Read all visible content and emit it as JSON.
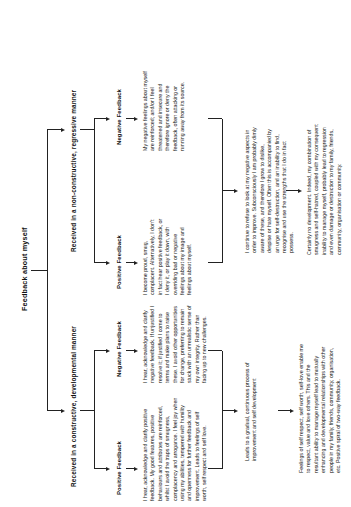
{
  "diagram": {
    "type": "flowchart",
    "orientation": "rotated-90-ccw",
    "root": {
      "label": "Feedback about myself"
    },
    "branches": [
      {
        "id": "constructive",
        "label": "Received in a constructive, developmental manner",
        "leaves": [
          {
            "id": "constructive-positive",
            "label": "Positive Feedback",
            "body": "I hear, acknowledge and clarify positive feedback. My good features, positive behaviours and attributes are reinforced, whilst I avoid the traps of smugness, complacency and arrogance. I feel joy when using my abilities, tempered with humility and openness for further feedback and improvement. Leads to feelings of self worth, self respect and self love."
          },
          {
            "id": "constructive-negative",
            "label": "Negative Feedback",
            "body": "I hear, acknowledge and clarify negative feedback. If unjustified I resolve it; if justified I come to terms and make plans to raise these. I avoid other opportunities for change, preferring to remain stuck with an unrealistic sense of my own integrity. Rather than facing up to new challenges."
          }
        ],
        "outcome_label": "Leads to a gradual, continuous process of improvement and self development",
        "outcome_body": "Feelings of self respect, self worth, self-love enable me to respect, value and love others. This and the resultant ability to manage myself lead to mutually enhancing and developmental relationships with other people in my family, friends, community, organisation, etc. Positive spiral of two-way feedback."
      },
      {
        "id": "non-constructive",
        "label": "Received in a non-constructive, regressive manner",
        "leaves": [
          {
            "id": "non-constructive-positive",
            "label": "Positive Feedback",
            "body": "I become proud, smug, complacent. Alternatively, I don't in fact hear positive feedback, or I deny it, or play it down, with overriding bad or negative feelings about my image and feelings about myself."
          },
          {
            "id": "non-constructive-negative",
            "label": "Negative Feedback",
            "body": "My negative feelings about myself are reinforced; and/or I feel threatened and insecure and therefore ignore or deny the feedback, often attacking or running away from its source."
          }
        ],
        "outcome_label": "I continue to refuse to look at my negative aspects in order to improve. Subconsciously I am probably dimly aware of these, and therefore I grow to dislike, despise or hate myself. Often this is accompanied by an urge for self-destruction, and an inability to find, recognise and use the strengths that I do in fact possess.",
        "outcome_body": "Certainly no development. Indeed, my combination of smugness and self-hatred, coupled with my consequent inability to manage myself, probably lead to regression and even damage or destruction to my family, friends, community, organisation or community."
      }
    ]
  }
}
